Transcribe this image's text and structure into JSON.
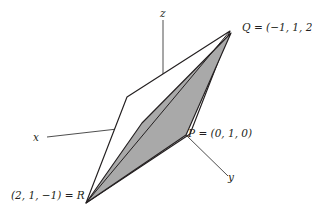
{
  "figure": {
    "kind": "3d-coordinate-diagram",
    "background_color": "#ffffff",
    "stroke_color": "#231f20",
    "axis_stroke_color": "#3a3a3a",
    "shaded_fill_color": "#a9a9a9",
    "unshaded_fill_color": "#ffffff"
  },
  "axes": {
    "x": {
      "label": "x",
      "tip_x": 47,
      "tip_y": 137,
      "origin_x": 163,
      "origin_y": 124
    },
    "y": {
      "label": "y",
      "tip_x": 228,
      "tip_y": 176,
      "origin_x": 186,
      "origin_y": 135
    },
    "z": {
      "label": "z",
      "tip_x": 163,
      "tip_y": 20,
      "origin_x": 163,
      "origin_y": 131
    }
  },
  "points": [
    {
      "name": "Q",
      "label": "Q = (−1, 1, 2)",
      "coords": [
        -1,
        1,
        2
      ],
      "px": 230,
      "py": 31
    },
    {
      "name": "P",
      "label": "P = (0, 1, 0)",
      "coords": [
        0,
        1,
        0
      ],
      "px": 186,
      "py": 135
    },
    {
      "name": "R",
      "label": "(2, 1, −1) = R",
      "coords": [
        2,
        1,
        -1
      ],
      "px": 86,
      "py": 203
    }
  ],
  "shapes": {
    "outer_parallelogram": {
      "name": "unshaded-parallelogram",
      "points": "86,203 127,97 230,31 190,134",
      "fill": "#ffffff"
    },
    "shaded_parallelogram": {
      "name": "shaded-parallelogram",
      "points": "86,203 142,123 231,33 186,135",
      "fill": "#a9a9a9"
    }
  }
}
